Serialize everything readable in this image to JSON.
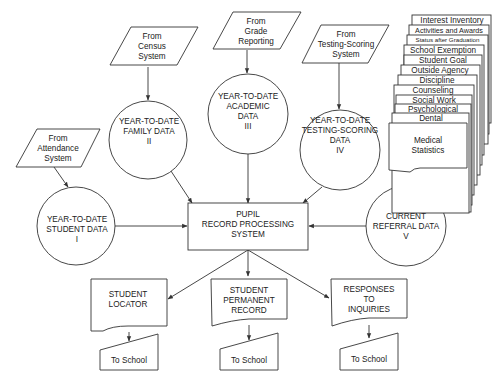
{
  "diagram": {
    "sources": [
      {
        "id": "attendance",
        "lines": [
          "From",
          "Attendance",
          "System"
        ]
      },
      {
        "id": "census",
        "lines": [
          "From",
          "Census",
          "System"
        ]
      },
      {
        "id": "grade",
        "lines": [
          "From",
          "Grade",
          "Reporting"
        ]
      },
      {
        "id": "testing",
        "lines": [
          "From",
          "Testing-Scoring",
          "System"
        ]
      }
    ],
    "data_stores": [
      {
        "id": "student",
        "lines": [
          "YEAR-TO-DATE",
          "STUDENT DATA",
          "I"
        ]
      },
      {
        "id": "family",
        "lines": [
          "YEAR-TO-DATE",
          "FAMILY DATA",
          "II"
        ]
      },
      {
        "id": "academic",
        "lines": [
          "YEAR-TO-DATE",
          "ACADEMIC",
          "DATA",
          "III"
        ]
      },
      {
        "id": "testing_scoring",
        "lines": [
          "YEAR-TO-DATE",
          "TESTING-SCORING",
          "DATA",
          "IV"
        ]
      },
      {
        "id": "referral",
        "lines": [
          "CURRENT",
          "REFERRAL DATA",
          "V"
        ]
      }
    ],
    "process": {
      "lines": [
        "PUPIL",
        "RECORD PROCESSING",
        "SYSTEM"
      ]
    },
    "document_stack": [
      "Interest Inventory",
      "Activities and Awards",
      "Status after Graduation",
      "School Exemption",
      "Student Goal",
      "Outside Agency",
      "Discipline",
      "Counseling",
      "Social Work",
      "Psychological",
      "Dental"
    ],
    "document_front": {
      "lines": [
        "Medical",
        "Statistics"
      ]
    },
    "outputs": [
      {
        "id": "locator",
        "lines": [
          "STUDENT",
          "LOCATOR"
        ],
        "destination": "To School"
      },
      {
        "id": "permanent",
        "lines": [
          "STUDENT",
          "PERMANENT",
          "RECORD"
        ],
        "destination": "To School"
      },
      {
        "id": "inquiries",
        "lines": [
          "RESPONSES",
          "TO",
          "INQUIRIES"
        ],
        "destination": "To School"
      }
    ]
  }
}
